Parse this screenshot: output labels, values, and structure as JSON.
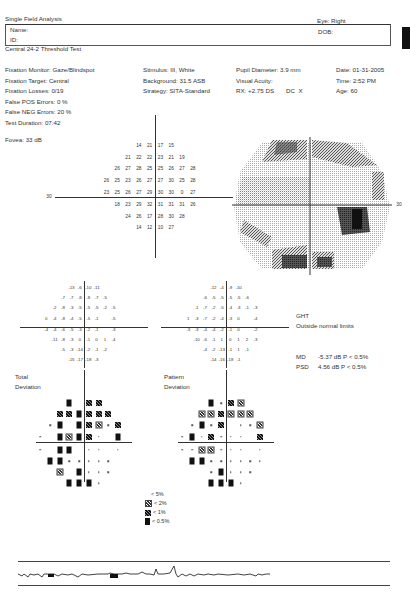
{
  "header": {
    "title": "Single Field Analysis",
    "eye_label": "Eye: Right",
    "name_label": "Name:",
    "id_label": "ID:",
    "dob_label": "DOB:",
    "test_name": "Central 24-2 Threshold Test"
  },
  "params": {
    "col1": [
      "Fixation Monitor: Gaze/Blindspot",
      "Fixation Target: Central",
      "Fixation Losses: 0/19",
      "False POS Errors:  0 %",
      "False NEG Errors:  20 %",
      "Test Duration: 07:42"
    ],
    "col2": [
      "Stimulus: III, White",
      "Background: 31.5 ASB",
      "Strategy: SITA-Standard"
    ],
    "col3": [
      "Pupil Diameter: 3.9 mm",
      "Visual Acuity:",
      "RX: +2.75 DS       DC  X"
    ],
    "col4": [
      "Date: 01-31-2005",
      "Time:  2:52 PM",
      "Age: 60"
    ],
    "fovea": "Fovea: 33 dB"
  },
  "threshold": {
    "axis_label_left": "30",
    "axis_label_right": "30",
    "rows": [
      [
        "14",
        "21",
        "17",
        "15"
      ],
      [
        "21",
        "22",
        "22",
        "23",
        "21",
        "19"
      ],
      [
        "26",
        "27",
        "28",
        "25",
        "25",
        "26",
        "27",
        "28"
      ],
      [
        "26",
        "25",
        "23",
        "26",
        "27",
        "27",
        "30",
        "25",
        "28"
      ],
      [
        "23",
        "25",
        "26",
        "27",
        "29",
        "30",
        "30",
        "0",
        "27"
      ],
      [
        "18",
        "23",
        "29",
        "32",
        "31",
        "31",
        "31",
        "26"
      ],
      [
        "24",
        "26",
        "17",
        "28",
        "30",
        "28"
      ],
      [
        "14",
        "12",
        "10",
        "27"
      ]
    ]
  },
  "total_deviation": {
    "rows": [
      [
        "-13",
        "-6",
        "-10",
        "-11"
      ],
      [
        "-7",
        "-7",
        "-8",
        "-8",
        "-7",
        "-5"
      ],
      [
        "-2",
        "-8",
        "-3",
        "-5",
        "-5",
        "-5",
        "-2",
        "-5"
      ],
      [
        "0",
        "-4",
        "-8",
        "-4",
        "-5",
        "-5",
        "-1",
        "",
        "-5"
      ],
      [
        "-4",
        "-4",
        "-6",
        "-5",
        "-3",
        "-2",
        "-1",
        "",
        "-3"
      ],
      [
        "-11",
        "-8",
        "-3",
        "0",
        "-1",
        "0",
        "1",
        "-4"
      ],
      [
        "-5",
        "-3",
        "-14",
        "-2",
        "-1",
        "-2"
      ],
      [
        "-15",
        "-17",
        "-18",
        "-3"
      ]
    ],
    "title1": "Total",
    "title2": "Deviation"
  },
  "pattern_deviation": {
    "rows": [
      [
        "-12",
        "-4",
        "-9",
        "-10"
      ],
      [
        "-6",
        "-5",
        "-5",
        "-5",
        "-5",
        "-6"
      ],
      [
        "-1",
        "-7",
        "-2",
        "-5",
        "-4",
        "-3",
        "-1",
        "-3"
      ],
      [
        "1",
        "-3",
        "-7",
        "-2",
        "-4",
        "-3",
        "0",
        "",
        "-4"
      ],
      [
        "-3",
        "-3",
        "-4",
        "-4",
        "-2",
        "-1",
        "0",
        "",
        "-2"
      ],
      [
        "-10",
        "-6",
        "-1",
        "1",
        "0",
        "1",
        "2",
        "-3"
      ],
      [
        "-4",
        "-2",
        "-13",
        "-1",
        "1",
        "-1"
      ],
      [
        "-14",
        "-16",
        "-18",
        "-1"
      ]
    ],
    "title1": "Pattern",
    "title2": "Deviation"
  },
  "total_prob_map": [
    [
      "B",
      "p5",
      "p1",
      "p1"
    ],
    [
      "p1",
      "p1",
      "B",
      "p1",
      "p1",
      "p1"
    ],
    [
      "d",
      "B",
      "p5",
      "B",
      "p1",
      "p2",
      "d",
      "p1"
    ],
    [
      "d",
      "p5",
      "B",
      "p2",
      "B",
      "p1",
      "d",
      "",
      "B"
    ],
    [
      "d",
      "p5",
      "B",
      "B",
      "p5",
      "d",
      "d",
      "",
      "d"
    ],
    [
      "B",
      "B",
      "d",
      "d",
      "d",
      "d",
      "d",
      "p5"
    ],
    [
      "p2",
      "p5",
      "B",
      "d",
      "d",
      "d"
    ],
    [
      "B",
      "B",
      "B",
      "d"
    ]
  ],
  "pattern_prob_map": [
    [
      "B",
      "d",
      "p1",
      "p2"
    ],
    [
      "p2",
      "p2",
      "p1",
      "p2",
      "p2",
      "p2"
    ],
    [
      "d",
      "B",
      "d",
      "p1",
      "p5",
      "d",
      "d",
      "p2"
    ],
    [
      "d",
      "B",
      "d",
      "p1",
      "d",
      "d",
      "d",
      "",
      "p1"
    ],
    [
      "d",
      "d",
      "p2",
      "p2",
      "d",
      "d",
      "d",
      "",
      "d"
    ],
    [
      "B",
      "B",
      "d",
      "d",
      "d",
      "d",
      "d",
      "d"
    ],
    [
      "p5",
      "d",
      "B",
      "d",
      "d",
      "d"
    ],
    [
      "B",
      "B",
      "B",
      "d"
    ]
  ],
  "ght": {
    "label": "GHT",
    "value": "Outside normal limits"
  },
  "indices": {
    "md_label": "MD",
    "md_value": "-5.37 dB  P < 0.5%",
    "psd_label": "PSD",
    "psd_value": "4.56 dB  P < 0.5%"
  },
  "legend": [
    {
      "sym": "p5",
      "label": "< 5%"
    },
    {
      "sym": "p2",
      "label": "< 2%"
    },
    {
      "sym": "p1",
      "label": "< 1%"
    },
    {
      "sym": "B",
      "label": "< 0.5%"
    }
  ]
}
